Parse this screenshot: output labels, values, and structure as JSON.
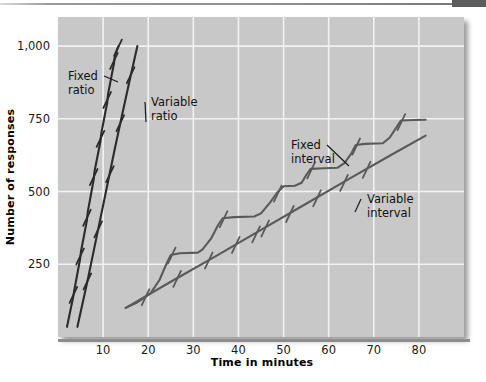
{
  "figure": {
    "name": "schedules-of-reinforcement-cumulative-record",
    "plot_bg": "#c8c8c8",
    "grid_color": "#f2f2f2",
    "page_bg": "#ffffff",
    "curve_dark": "#2b2b2b",
    "curve_mid": "#555555",
    "curve_light": "#6e6e6e"
  },
  "axes": {
    "x_label": "Time in minutes",
    "y_label": "Number of responses",
    "x_ticks": [
      10,
      20,
      30,
      40,
      50,
      60,
      70,
      80
    ],
    "x_tick_labels": [
      "10",
      "20",
      "30",
      "40",
      "50",
      "60",
      "70",
      "80"
    ],
    "y_ticks": [
      250,
      500,
      750,
      1000
    ],
    "y_tick_labels": [
      "250",
      "500",
      "750",
      "1,000"
    ],
    "xlim": [
      0,
      90
    ],
    "ylim": [
      0,
      1100
    ],
    "grid": true
  },
  "chart_data": {
    "type": "line",
    "title": "",
    "xlabel": "Time in minutes",
    "ylabel": "Number of responses",
    "xlim": [
      0,
      90
    ],
    "ylim": [
      0,
      1100
    ],
    "grid": true,
    "legend_position": "inline-annotations",
    "series": [
      {
        "name": "Fixed ratio",
        "label": "Fixed\nratio",
        "color": "#2b2b2b",
        "shape": "steep-staircase",
        "points": [
          [
            2.0,
            35
          ],
          [
            3.4,
            140
          ],
          [
            3.6,
            160
          ],
          [
            4.9,
            268
          ],
          [
            5.1,
            295
          ],
          [
            6.4,
            400
          ],
          [
            6.6,
            430
          ],
          [
            7.9,
            540
          ],
          [
            8.1,
            570
          ],
          [
            9.4,
            672
          ],
          [
            9.6,
            700
          ],
          [
            10.9,
            805
          ],
          [
            11.1,
            835
          ],
          [
            12.4,
            940
          ],
          [
            12.6,
            968
          ],
          [
            13.4,
            1000
          ]
        ],
        "reinforcement_marks": [
          [
            3.5,
            150
          ],
          [
            5.0,
            282
          ],
          [
            6.5,
            415
          ],
          [
            8.0,
            555
          ],
          [
            9.5,
            686
          ],
          [
            11.0,
            820
          ],
          [
            12.5,
            954
          ],
          [
            13.4,
            1000
          ]
        ]
      },
      {
        "name": "Variable ratio",
        "label": "Variable\nratio",
        "color": "#2b2b2b",
        "shape": "steep-smooth",
        "points": [
          [
            4.3,
            35
          ],
          [
            6.5,
            190
          ],
          [
            8.5,
            340
          ],
          [
            10.5,
            490
          ],
          [
            12.5,
            640
          ],
          [
            14.3,
            770
          ],
          [
            16.0,
            890
          ],
          [
            17.6,
            1000
          ]
        ],
        "reinforcement_marks": [
          [
            6.6,
            196
          ],
          [
            9.0,
            375
          ],
          [
            11.6,
            565
          ],
          [
            13.9,
            740
          ],
          [
            16.2,
            905
          ]
        ]
      },
      {
        "name": "Fixed interval",
        "label": "Fixed\ninterval",
        "color": "#5a5a5a",
        "shape": "scalloped-staircase",
        "points": [
          [
            15.0,
            100
          ],
          [
            17.5,
            118
          ],
          [
            20.5,
            150
          ],
          [
            22.5,
            196
          ],
          [
            24.0,
            250
          ],
          [
            25.0,
            282
          ],
          [
            27.0,
            288
          ],
          [
            31.0,
            290
          ],
          [
            32.0,
            300
          ],
          [
            34.0,
            340
          ],
          [
            35.5,
            385
          ],
          [
            36.5,
            408
          ],
          [
            39.0,
            412
          ],
          [
            43.5,
            414
          ],
          [
            45.0,
            425
          ],
          [
            47.0,
            462
          ],
          [
            48.5,
            495
          ],
          [
            50.0,
            518
          ],
          [
            52.5,
            520
          ],
          [
            54.0,
            530
          ],
          [
            55.0,
            556
          ],
          [
            56.0,
            578
          ],
          [
            59.0,
            580
          ],
          [
            62.0,
            582
          ],
          [
            63.5,
            598
          ],
          [
            65.0,
            630
          ],
          [
            66.0,
            660
          ],
          [
            68.0,
            664
          ],
          [
            72.0,
            666
          ],
          [
            73.5,
            685
          ],
          [
            75.0,
            720
          ],
          [
            76.0,
            744
          ],
          [
            79.0,
            746
          ],
          [
            81.5,
            747
          ]
        ],
        "reinforcement_marks": [
          [
            25.3,
            285
          ],
          [
            36.8,
            410
          ],
          [
            48.8,
            498
          ],
          [
            56.2,
            578
          ],
          [
            66.2,
            660
          ],
          [
            76.2,
            744
          ]
        ]
      },
      {
        "name": "Variable interval",
        "label": "Variable\ninterval",
        "color": "#5a5a5a",
        "shape": "steady-linear",
        "points": [
          [
            15.0,
            100
          ],
          [
            25.0,
            190
          ],
          [
            35.0,
            278
          ],
          [
            45.0,
            368
          ],
          [
            55.0,
            458
          ],
          [
            65.0,
            548
          ],
          [
            75.0,
            636
          ],
          [
            81.5,
            692
          ]
        ],
        "reinforcement_marks": [
          [
            19.5,
            142
          ],
          [
            26.5,
            205
          ],
          [
            33.5,
            268
          ],
          [
            39.5,
            322
          ],
          [
            44.0,
            358
          ],
          [
            46.0,
            378
          ],
          [
            51.5,
            428
          ],
          [
            57.5,
            482
          ],
          [
            63.5,
            535
          ],
          [
            68.5,
            580
          ]
        ]
      }
    ],
    "annotations": [
      {
        "text_lines": [
          "Fixed",
          "ratio"
        ],
        "x": 68,
        "y": 80,
        "leader_to_x": 118,
        "leader_to_y": 82
      },
      {
        "text_lines": [
          "Variable",
          "ratio"
        ],
        "x": 151,
        "y": 106,
        "leader_to_x": 146,
        "leader_to_y": 122
      },
      {
        "text_lines": [
          "Fixed",
          "interval"
        ],
        "x": 291,
        "y": 149,
        "leader_to_x": 349,
        "leader_to_y": 166
      },
      {
        "text_lines": [
          "Variable",
          "interval"
        ],
        "x": 367,
        "y": 203,
        "leader_to_x": 355,
        "leader_to_y": 212
      }
    ]
  }
}
